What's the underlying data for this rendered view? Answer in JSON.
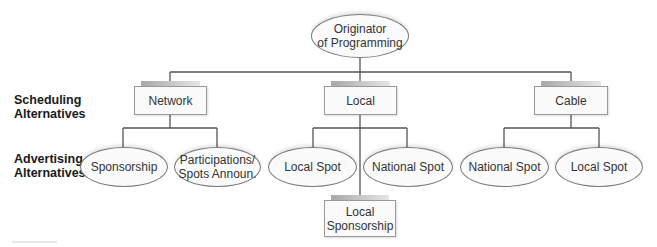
{
  "diagram": {
    "root": {
      "label_line1": "Originator",
      "label_line2": "of Programming"
    },
    "row_labels": {
      "scheduling": {
        "line1": "Scheduling",
        "line2": "Alternatives"
      },
      "advertising": {
        "line1": "Advertising",
        "line2": "Alternatives"
      }
    },
    "scheduling_alternatives": [
      {
        "label": "Network"
      },
      {
        "label": "Local"
      },
      {
        "label": "Cable"
      }
    ],
    "advertising_alternatives": {
      "network": [
        {
          "label_line1": "Sponsorship",
          "label_line2": ""
        },
        {
          "label_line1": "Participations/",
          "label_line2": "Spots Announ."
        }
      ],
      "local": [
        {
          "label_line1": "Local Spot",
          "label_line2": ""
        },
        {
          "label_line1": "National Spot",
          "label_line2": ""
        }
      ],
      "local_extra": {
        "label_line1": "Local",
        "label_line2": "Sponsorship"
      },
      "cable": [
        {
          "label_line1": "National Spot",
          "label_line2": ""
        },
        {
          "label_line1": "Local Spot",
          "label_line2": ""
        }
      ]
    },
    "colors": {
      "line": "#555555",
      "border": "#9a9a9a",
      "fill": "#fafafa"
    }
  }
}
